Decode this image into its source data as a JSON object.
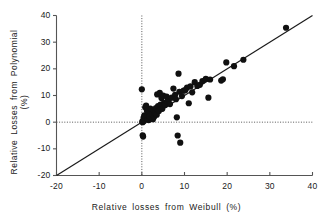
{
  "chart_data": {
    "type": "scatter",
    "title": "",
    "xlabel": "Relative losses from Weibull (%)",
    "ylabel": "Relative Losses from Polynomial (%)",
    "xlim": [
      -20,
      40
    ],
    "ylim": [
      -20,
      40
    ],
    "xticks": [
      -20,
      -10,
      0,
      10,
      20,
      30,
      40
    ],
    "yticks": [
      -20,
      -10,
      0,
      10,
      20,
      30,
      40
    ],
    "xtick_labels": [
      "-20",
      "-10",
      "0",
      "10",
      "20",
      "30",
      "40"
    ],
    "ytick_labels": [
      "-20",
      "-10",
      "0",
      "10",
      "20",
      "30",
      "40"
    ],
    "grid": false,
    "legend": null,
    "marker": {
      "shape": "circle",
      "color": "#101010",
      "size": 3.1
    },
    "reference_lines": [
      {
        "name": "identity-line",
        "kind": "diagonal",
        "from": [
          -20,
          -20
        ],
        "to": [
          40,
          40
        ],
        "style": "solid",
        "color": "#1a1a1a"
      },
      {
        "name": "zero-vertical",
        "kind": "vertical",
        "at": 0,
        "style": "dotted",
        "color": "#555555"
      },
      {
        "name": "zero-horizontal",
        "kind": "horizontal",
        "at": 0,
        "style": "dotted",
        "color": "#555555"
      }
    ],
    "points": [
      [
        0.0,
        12.3
      ],
      [
        0.1,
        0.2
      ],
      [
        0.2,
        0.0
      ],
      [
        0.2,
        -4.9
      ],
      [
        0.3,
        -5.4
      ],
      [
        0.4,
        1.6
      ],
      [
        0.5,
        0.4
      ],
      [
        0.6,
        2.6
      ],
      [
        0.8,
        5.6
      ],
      [
        1.0,
        6.2
      ],
      [
        1.2,
        4.3
      ],
      [
        1.3,
        1.0
      ],
      [
        1.5,
        3.7
      ],
      [
        1.6,
        0.8
      ],
      [
        1.8,
        2.2
      ],
      [
        2.0,
        5.1
      ],
      [
        2.2,
        1.2
      ],
      [
        2.4,
        3.0
      ],
      [
        2.6,
        1.1
      ],
      [
        2.8,
        4.6
      ],
      [
        2.9,
        2.0
      ],
      [
        3.1,
        3.4
      ],
      [
        3.3,
        5.3
      ],
      [
        3.5,
        2.8
      ],
      [
        3.6,
        10.4
      ],
      [
        3.8,
        6.0
      ],
      [
        4.0,
        4.2
      ],
      [
        4.2,
        11.0
      ],
      [
        4.4,
        6.6
      ],
      [
        4.6,
        9.1
      ],
      [
        4.8,
        5.0
      ],
      [
        5.0,
        10.0
      ],
      [
        5.2,
        7.2
      ],
      [
        5.5,
        6.4
      ],
      [
        5.8,
        9.6
      ],
      [
        6.0,
        7.8
      ],
      [
        6.3,
        8.4
      ],
      [
        6.6,
        6.8
      ],
      [
        7.0,
        9.2
      ],
      [
        7.4,
        12.6
      ],
      [
        7.8,
        10.2
      ],
      [
        8.0,
        8.6
      ],
      [
        8.2,
        1.8
      ],
      [
        8.4,
        -5.0
      ],
      [
        8.6,
        18.2
      ],
      [
        8.8,
        11.4
      ],
      [
        9.0,
        -7.7
      ],
      [
        9.4,
        9.8
      ],
      [
        9.8,
        11.8
      ],
      [
        10.2,
        12.0
      ],
      [
        10.6,
        13.0
      ],
      [
        11.0,
        7.1
      ],
      [
        11.4,
        13.4
      ],
      [
        11.8,
        11.2
      ],
      [
        12.4,
        15.0
      ],
      [
        13.0,
        13.6
      ],
      [
        13.6,
        14.0
      ],
      [
        14.2,
        15.4
      ],
      [
        15.0,
        16.2
      ],
      [
        15.6,
        9.2
      ],
      [
        16.0,
        16.0
      ],
      [
        18.6,
        15.6
      ],
      [
        19.0,
        16.1
      ],
      [
        19.8,
        22.4
      ],
      [
        21.6,
        21.0
      ],
      [
        23.8,
        23.4
      ],
      [
        33.8,
        35.4
      ]
    ]
  }
}
